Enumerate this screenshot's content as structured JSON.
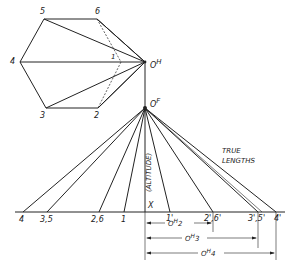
{
  "diagram": {
    "top_view": {
      "vertices": {
        "1": "1",
        "2": "2",
        "3": "3",
        "4": "4",
        "5": "5",
        "6": "6"
      },
      "apex_label": "O",
      "apex_sup": "H"
    },
    "front_view": {
      "apex_label": "O",
      "apex_sup": "F",
      "altitude_label": "(ALTITUDE)",
      "x_label": "X",
      "base_points": [
        "4",
        "3,5",
        "2,6",
        "1"
      ],
      "true_points": [
        "1'",
        "2',6'",
        "3',5'",
        "4'"
      ],
      "true_lengths_label": [
        "TRUE",
        "LENGTHS"
      ]
    },
    "dimensions": [
      {
        "label": "O",
        "sup": "H",
        "suffix": "2"
      },
      {
        "label": "O",
        "sup": "H",
        "suffix": "3"
      },
      {
        "label": "O",
        "sup": "H",
        "suffix": "4"
      }
    ]
  }
}
